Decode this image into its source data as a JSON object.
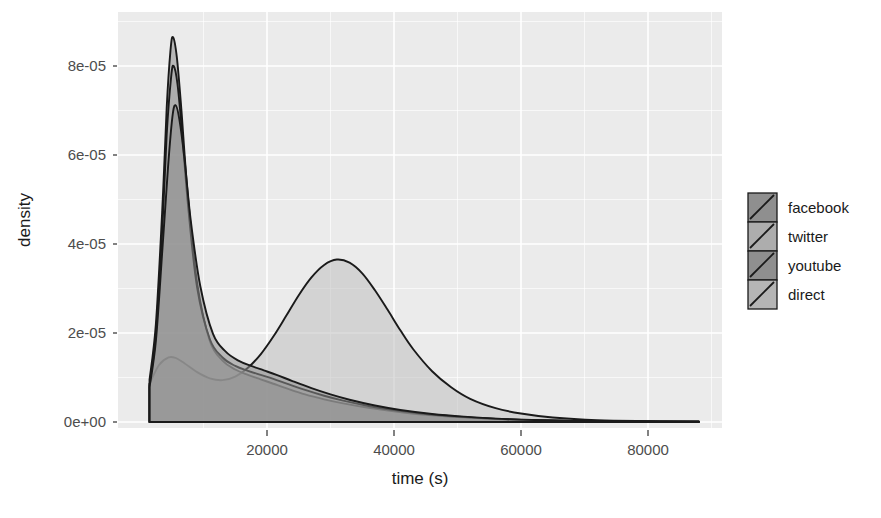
{
  "chart_data": {
    "type": "area",
    "title": "",
    "subtitle": "",
    "xlabel": "time (s)",
    "ylabel": "density",
    "xlim": [
      0,
      92000
    ],
    "ylim": [
      0,
      9.2e-05
    ],
    "xticks": [
      20000,
      40000,
      60000,
      80000
    ],
    "xticklabels": [
      "20000",
      "40000",
      "60000",
      "80000"
    ],
    "yticks": [
      0,
      2e-05,
      4e-05,
      6e-05,
      8e-05
    ],
    "yticklabels": [
      "0e+00",
      "2e-05",
      "4e-05",
      "6e-05",
      "8e-05"
    ],
    "grid": true,
    "legend_position": "right",
    "legend_title": "",
    "panel_background": "#ebebeb",
    "grid_color": "#ffffff",
    "series": [
      {
        "name": "facebook",
        "fill": "#8c8c8c",
        "line": "#1a1a1a",
        "peak_x": 5200,
        "peak_y": 8.65e-05,
        "x": [
          1500,
          2500,
          3500,
          4200,
          4800,
          5200,
          5800,
          6500,
          7500,
          9000,
          11000,
          13000,
          15000,
          17000,
          19000,
          21000,
          23000,
          26000,
          29000,
          32000,
          36000,
          40000,
          45000,
          50000,
          56000,
          62000,
          70000,
          80000,
          88000
        ],
        "y": [
          9.5e-06,
          2.2e-05,
          4.75e-05,
          7.05e-05,
          8.35e-05,
          8.65e-05,
          8.2e-05,
          7.05e-05,
          5.15e-05,
          3.12e-05,
          1.82e-05,
          1.38e-05,
          1.18e-05,
          1.06e-05,
          9.6e-06,
          8.6e-06,
          7.6e-06,
          6.2e-06,
          5.1e-06,
          4.2e-06,
          3.2e-06,
          2.4e-06,
          1.6e-06,
          1.1e-06,
          7e-07,
          4e-07,
          2e-07,
          1e-07,
          5e-08
        ]
      },
      {
        "name": "twitter",
        "fill": "#a6a6a6",
        "line": "#1a1a1a",
        "peak_x": 5300,
        "peak_y": 8e-05,
        "x": [
          1500,
          2500,
          3500,
          4200,
          4900,
          5300,
          5900,
          6600,
          7600,
          9000,
          11000,
          13000,
          15000,
          17000,
          19000,
          21000,
          23000,
          26000,
          29000,
          32000,
          36000,
          40000,
          45000,
          50000,
          56000,
          62000,
          70000,
          80000,
          88000
        ],
        "y": [
          8.2e-06,
          1.98e-05,
          4.32e-05,
          6.45e-05,
          7.75e-05,
          8e-05,
          7.6e-05,
          6.55e-05,
          4.82e-05,
          3.02e-05,
          1.86e-05,
          1.45e-05,
          1.26e-05,
          1.15e-05,
          1.06e-05,
          9.7e-06,
          8.7e-06,
          7.2e-06,
          5.9e-06,
          4.8e-06,
          3.6e-06,
          2.7e-06,
          1.8e-06,
          1.2e-06,
          7e-07,
          4e-07,
          2e-07,
          1e-07,
          5e-08
        ]
      },
      {
        "name": "youtube",
        "fill": "#8c8c8c",
        "line": "#1a1a1a",
        "peak_x": 5600,
        "peak_y": 7.12e-05,
        "x": [
          1500,
          2500,
          3500,
          4400,
          5100,
          5600,
          6200,
          7000,
          8000,
          9500,
          11500,
          13500,
          15500,
          17500,
          19500,
          21500,
          24000,
          27000,
          30000,
          33000,
          37000,
          41000,
          46000,
          51000,
          57000,
          63000,
          71000,
          80000,
          88000
        ],
        "y": [
          7.8e-06,
          1.82e-05,
          3.82e-05,
          5.7e-05,
          6.85e-05,
          7.12e-05,
          6.8e-05,
          5.92e-05,
          4.52e-05,
          3.05e-05,
          1.98e-05,
          1.58e-05,
          1.38e-05,
          1.26e-05,
          1.16e-05,
          1.06e-05,
          9.2e-06,
          7.6e-06,
          6.2e-06,
          5e-06,
          3.7e-06,
          2.7e-06,
          1.8e-06,
          1.2e-06,
          7e-07,
          4e-07,
          2e-07,
          1e-07,
          5e-08
        ]
      },
      {
        "name": "direct",
        "fill": "#bfbfbf",
        "line": "#1a1a1a",
        "peak_x": 31000,
        "peak_y": 3.65e-05,
        "x": [
          1500,
          3000,
          4500,
          5600,
          7000,
          9000,
          11000,
          13000,
          15000,
          17000,
          19000,
          21000,
          23000,
          25000,
          27000,
          29000,
          31000,
          33000,
          35000,
          37000,
          39000,
          41000,
          43000,
          46000,
          49000,
          52000,
          56000,
          60000,
          65000,
          72000,
          80000,
          88000
        ],
        "y": [
          8.6e-06,
          1.28e-05,
          1.45e-05,
          1.44e-05,
          1.32e-05,
          1.12e-05,
          9.8e-06,
          9.4e-06,
          1.02e-05,
          1.22e-05,
          1.52e-05,
          1.92e-05,
          2.38e-05,
          2.85e-05,
          3.25e-05,
          3.53e-05,
          3.65e-05,
          3.58e-05,
          3.34e-05,
          2.96e-05,
          2.52e-05,
          2.06e-05,
          1.64e-05,
          1.14e-05,
          7.8e-06,
          5.2e-06,
          3.1e-06,
          1.9e-06,
          1e-06,
          4e-07,
          2e-07,
          1e-07
        ]
      }
    ],
    "legend_entries": [
      {
        "label": "facebook",
        "swatch_fill": "#8f8f8f"
      },
      {
        "label": "twitter",
        "swatch_fill": "#adadad"
      },
      {
        "label": "youtube",
        "swatch_fill": "#8f8f8f"
      },
      {
        "label": "direct",
        "swatch_fill": "#b5b5b5"
      }
    ]
  }
}
